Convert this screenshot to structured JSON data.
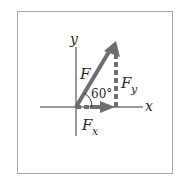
{
  "diagram": {
    "axes": {
      "x_label": "x",
      "y_label": "y"
    },
    "vectors": {
      "force": {
        "label": "F"
      },
      "x_component": {
        "label_main": "F",
        "label_sub": "x"
      },
      "y_component": {
        "label_main": "F",
        "label_sub": "y"
      }
    },
    "angle": {
      "label": "60°"
    },
    "colors": {
      "vector": "#6e6e6e",
      "axes": "#333333",
      "border": "#a8a8a8"
    }
  }
}
